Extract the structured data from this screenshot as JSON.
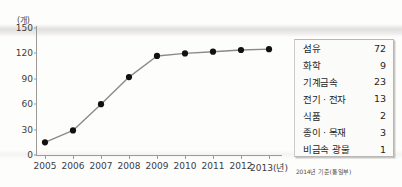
{
  "chart_data": {
    "type": "line",
    "title": "",
    "xlabel": "2013(년)",
    "ylabel": "(개)",
    "unit_label": "(개)",
    "categories": [
      "2005",
      "2006",
      "2007",
      "2008",
      "2009",
      "2010",
      "2011",
      "2012",
      "2013(년)"
    ],
    "x_tick_labels": [
      "2005",
      "2006",
      "2007",
      "2008",
      "2009",
      "2010",
      "2011",
      "2012",
      "2013(년)"
    ],
    "y_tick_labels": [
      "150",
      "120",
      "90",
      "60",
      "30",
      "0"
    ],
    "ylim": [
      0,
      150
    ],
    "y_ticks": [
      0,
      30,
      60,
      90,
      120,
      150
    ],
    "grid": false,
    "legend_position": "none",
    "marker": "filled-circle",
    "line_color": "#8c8a86",
    "marker_color": "#111111",
    "series": [
      {
        "name": "업체 수",
        "values": [
          15,
          29,
          60,
          92,
          117,
          120,
          122,
          124,
          125
        ]
      }
    ]
  },
  "legend_table": {
    "rows": [
      {
        "label": "섬유",
        "value": "72"
      },
      {
        "label": "화학",
        "value": "9"
      },
      {
        "label": "기계금속",
        "value": "23"
      },
      {
        "label": "전기 · 전자",
        "value": "13"
      },
      {
        "label": "식품",
        "value": "2"
      },
      {
        "label": "종이 · 목재",
        "value": "3"
      },
      {
        "label": "비금속 광물",
        "value": "1"
      }
    ]
  },
  "source_note": "2014년 기준(통일부)"
}
